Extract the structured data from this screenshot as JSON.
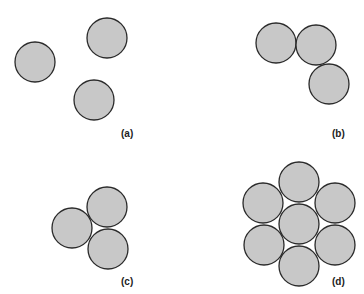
{
  "style": {
    "fill": "#c8c8c8",
    "stroke": "#2a2a2a",
    "radius": 20
  },
  "panels": [
    {
      "label": "(a)",
      "label_pos": [
        121,
        128
      ],
      "circles": [
        [
          35,
          62
        ],
        [
          107,
          38
        ],
        [
          94,
          100
        ]
      ]
    },
    {
      "label": "(b)",
      "label_pos": [
        332,
        128
      ],
      "circles": [
        [
          276,
          43
        ],
        [
          316,
          45
        ],
        [
          329,
          84
        ]
      ]
    },
    {
      "label": "(c)",
      "label_pos": [
        121,
        276
      ],
      "circles": [
        [
          72,
          228
        ],
        [
          107,
          207
        ],
        [
          108,
          249
        ]
      ]
    },
    {
      "label": "(d)",
      "label_pos": [
        332,
        276
      ],
      "circles": [
        [
          299,
          182
        ],
        [
          263,
          203
        ],
        [
          335,
          203
        ],
        [
          299,
          224
        ],
        [
          264,
          245
        ],
        [
          335,
          245
        ],
        [
          299,
          266
        ]
      ]
    }
  ]
}
